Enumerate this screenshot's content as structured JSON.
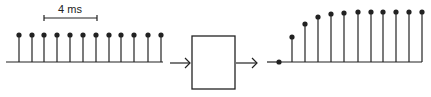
{
  "scale_bar": {
    "label": "4 ms",
    "x1": 44,
    "x2": 97,
    "y": 18
  },
  "input_signal": {
    "name": "step input (constant samples)",
    "baseline": {
      "x1": 6,
      "x2": 163,
      "y": 62
    },
    "stems": [
      {
        "x": 19,
        "top": 35
      },
      {
        "x": 32,
        "top": 35
      },
      {
        "x": 44,
        "top": 35
      },
      {
        "x": 57,
        "top": 35
      },
      {
        "x": 70,
        "top": 35
      },
      {
        "x": 83,
        "top": 35
      },
      {
        "x": 96,
        "top": 35
      },
      {
        "x": 109,
        "top": 35
      },
      {
        "x": 121,
        "top": 35
      },
      {
        "x": 134,
        "top": 35
      },
      {
        "x": 148,
        "top": 35
      },
      {
        "x": 161,
        "top": 35
      }
    ]
  },
  "input_arrow": {
    "x1": 170,
    "x2": 190,
    "y": 63
  },
  "system_box": {
    "x": 192,
    "y": 36,
    "width": 43,
    "height": 53
  },
  "output_arrow": {
    "x1": 236,
    "x2": 257,
    "y": 63
  },
  "output_signal": {
    "name": "step response (rising samples)",
    "lead_line": {
      "x1": 267,
      "x2": 279,
      "y": 62
    },
    "baseline": {
      "x1": 279,
      "x2": 422,
      "y": 62
    },
    "zero_sample": {
      "x": 279,
      "y": 62
    },
    "stems": [
      {
        "x": 292,
        "top": 37
      },
      {
        "x": 305,
        "top": 24
      },
      {
        "x": 318,
        "top": 17
      },
      {
        "x": 331,
        "top": 14
      },
      {
        "x": 344,
        "top": 13
      },
      {
        "x": 358,
        "top": 12
      },
      {
        "x": 371,
        "top": 12
      },
      {
        "x": 383,
        "top": 12
      },
      {
        "x": 396,
        "top": 12
      },
      {
        "x": 409,
        "top": 12
      },
      {
        "x": 422,
        "top": 12
      }
    ]
  },
  "colors": {
    "stroke": "#222222",
    "background": "#ffffff"
  }
}
